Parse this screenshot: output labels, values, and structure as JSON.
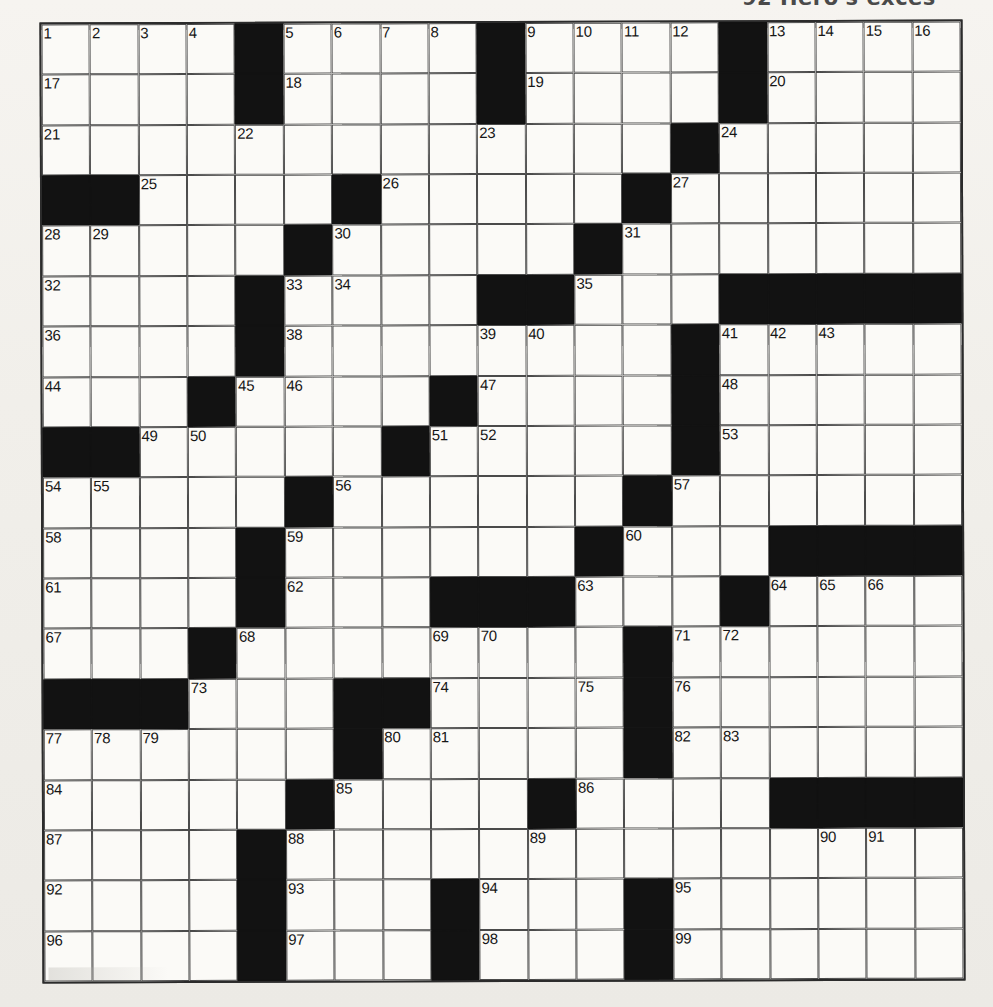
{
  "page": {
    "clue_fragment": "92  Hero's exces"
  },
  "grid": {
    "columns": 19,
    "rows": 19,
    "colors": {
      "block": "#121212",
      "cell": "#fbfaf7",
      "rule": "#4a4a4a",
      "number": "#161616",
      "paper": "#f2f0ec"
    },
    "legend": {
      "W": "open letter square",
      "B": "blocked square"
    },
    "pattern": [
      "WWWWBWWWWBWWWWBWWWW",
      "WWWWBWWWWBWWWWBWWWW",
      "WWWWWWWWWWWWWBWWWWW",
      "BBWWWWBWWWWWBWWWWWW",
      "WWWWWBWWWWWBWWWWWWW",
      "WWWWBWWWWBBWWWBBBBB",
      "WWWWBWWWWWWWWBWWWWW",
      "WWWBWWWWBWWWWBWWWWW",
      "BBWWWWWBWWWWWBWWWWW",
      "WWWWWBWWWWWWBWWWWWW",
      "WWWWBWWWWWWBWWWBBBB",
      "WWWWBWWWBBBWWWBWWWW",
      "WWWBWWWWWWWWBWWWWWW",
      "BBBWWWBBWWWWBWWWWWW",
      "WWWWWWBWWWWWBWWWWWW",
      "WWWWWBWWWWBWWWWBBBB",
      "WWWWBWWWWWWWWWWWWWW",
      "WWWWBWWWBWWWBWWWWWW",
      "WWWWBWWWBWWWBWWWWWW"
    ],
    "numbers": [
      {
        "row": 1,
        "col": 1,
        "label": "1"
      },
      {
        "row": 1,
        "col": 2,
        "label": "2"
      },
      {
        "row": 1,
        "col": 3,
        "label": "3"
      },
      {
        "row": 1,
        "col": 4,
        "label": "4"
      },
      {
        "row": 1,
        "col": 6,
        "label": "5"
      },
      {
        "row": 1,
        "col": 7,
        "label": "6"
      },
      {
        "row": 1,
        "col": 8,
        "label": "7"
      },
      {
        "row": 1,
        "col": 9,
        "label": "8"
      },
      {
        "row": 1,
        "col": 11,
        "label": "9"
      },
      {
        "row": 1,
        "col": 12,
        "label": "10"
      },
      {
        "row": 1,
        "col": 13,
        "label": "11"
      },
      {
        "row": 1,
        "col": 14,
        "label": "12"
      },
      {
        "row": 1,
        "col": 16,
        "label": "13"
      },
      {
        "row": 1,
        "col": 17,
        "label": "14"
      },
      {
        "row": 1,
        "col": 18,
        "label": "15"
      },
      {
        "row": 1,
        "col": 19,
        "label": "16"
      },
      {
        "row": 2,
        "col": 1,
        "label": "17"
      },
      {
        "row": 2,
        "col": 6,
        "label": "18"
      },
      {
        "row": 2,
        "col": 11,
        "label": "19"
      },
      {
        "row": 2,
        "col": 16,
        "label": "20"
      },
      {
        "row": 3,
        "col": 1,
        "label": "21"
      },
      {
        "row": 3,
        "col": 5,
        "label": "22"
      },
      {
        "row": 3,
        "col": 10,
        "label": "23"
      },
      {
        "row": 3,
        "col": 15,
        "label": "24"
      },
      {
        "row": 4,
        "col": 3,
        "label": "25"
      },
      {
        "row": 4,
        "col": 8,
        "label": "26"
      },
      {
        "row": 4,
        "col": 14,
        "label": "27"
      },
      {
        "row": 5,
        "col": 1,
        "label": "28"
      },
      {
        "row": 5,
        "col": 2,
        "label": "29"
      },
      {
        "row": 5,
        "col": 7,
        "label": "30"
      },
      {
        "row": 5,
        "col": 13,
        "label": "31"
      },
      {
        "row": 6,
        "col": 1,
        "label": "32"
      },
      {
        "row": 6,
        "col": 6,
        "label": "33"
      },
      {
        "row": 6,
        "col": 7,
        "label": "34"
      },
      {
        "row": 6,
        "col": 12,
        "label": "35"
      },
      {
        "row": 7,
        "col": 1,
        "label": "36"
      },
      {
        "row": 7,
        "col": 5,
        "label": "37"
      },
      {
        "row": 7,
        "col": 6,
        "label": "38"
      },
      {
        "row": 7,
        "col": 10,
        "label": "39"
      },
      {
        "row": 7,
        "col": 11,
        "label": "40"
      },
      {
        "row": 7,
        "col": 15,
        "label": "41"
      },
      {
        "row": 7,
        "col": 16,
        "label": "42"
      },
      {
        "row": 7,
        "col": 17,
        "label": "43"
      },
      {
        "row": 8,
        "col": 1,
        "label": "44"
      },
      {
        "row": 8,
        "col": 5,
        "label": "45"
      },
      {
        "row": 8,
        "col": 6,
        "label": "46"
      },
      {
        "row": 8,
        "col": 10,
        "label": "47"
      },
      {
        "row": 8,
        "col": 15,
        "label": "48"
      },
      {
        "row": 9,
        "col": 3,
        "label": "49"
      },
      {
        "row": 9,
        "col": 4,
        "label": "50"
      },
      {
        "row": 9,
        "col": 9,
        "label": "51"
      },
      {
        "row": 9,
        "col": 10,
        "label": "52"
      },
      {
        "row": 9,
        "col": 15,
        "label": "53"
      },
      {
        "row": 10,
        "col": 1,
        "label": "54"
      },
      {
        "row": 10,
        "col": 2,
        "label": "55"
      },
      {
        "row": 10,
        "col": 7,
        "label": "56"
      },
      {
        "row": 10,
        "col": 14,
        "label": "57"
      },
      {
        "row": 11,
        "col": 1,
        "label": "58"
      },
      {
        "row": 11,
        "col": 6,
        "label": "59"
      },
      {
        "row": 11,
        "col": 13,
        "label": "60"
      },
      {
        "row": 12,
        "col": 1,
        "label": "61"
      },
      {
        "row": 12,
        "col": 6,
        "label": "62"
      },
      {
        "row": 12,
        "col": 12,
        "label": "63"
      },
      {
        "row": 12,
        "col": 16,
        "label": "64"
      },
      {
        "row": 12,
        "col": 17,
        "label": "65"
      },
      {
        "row": 12,
        "col": 18,
        "label": "66"
      },
      {
        "row": 13,
        "col": 1,
        "label": "67"
      },
      {
        "row": 13,
        "col": 5,
        "label": "68"
      },
      {
        "row": 13,
        "col": 9,
        "label": "69"
      },
      {
        "row": 13,
        "col": 10,
        "label": "70"
      },
      {
        "row": 13,
        "col": 14,
        "label": "71"
      },
      {
        "row": 13,
        "col": 15,
        "label": "72"
      },
      {
        "row": 14,
        "col": 4,
        "label": "73"
      },
      {
        "row": 14,
        "col": 9,
        "label": "74"
      },
      {
        "row": 14,
        "col": 12,
        "label": "75"
      },
      {
        "row": 14,
        "col": 14,
        "label": "76"
      },
      {
        "row": 15,
        "col": 1,
        "label": "77"
      },
      {
        "row": 15,
        "col": 2,
        "label": "78"
      },
      {
        "row": 15,
        "col": 3,
        "label": "79"
      },
      {
        "row": 15,
        "col": 8,
        "label": "80"
      },
      {
        "row": 15,
        "col": 9,
        "label": "81"
      },
      {
        "row": 15,
        "col": 14,
        "label": "82"
      },
      {
        "row": 15,
        "col": 15,
        "label": "83"
      },
      {
        "row": 16,
        "col": 1,
        "label": "84"
      },
      {
        "row": 16,
        "col": 7,
        "label": "85"
      },
      {
        "row": 16,
        "col": 12,
        "label": "86"
      },
      {
        "row": 17,
        "col": 1,
        "label": "87"
      },
      {
        "row": 17,
        "col": 6,
        "label": "88"
      },
      {
        "row": 17,
        "col": 11,
        "label": "89"
      },
      {
        "row": 17,
        "col": 17,
        "label": "90"
      },
      {
        "row": 17,
        "col": 18,
        "label": "91"
      },
      {
        "row": 18,
        "col": 1,
        "label": "92"
      },
      {
        "row": 18,
        "col": 6,
        "label": "93"
      },
      {
        "row": 18,
        "col": 10,
        "label": "94"
      },
      {
        "row": 18,
        "col": 14,
        "label": "95"
      },
      {
        "row": 19,
        "col": 1,
        "label": "96"
      },
      {
        "row": 19,
        "col": 6,
        "label": "97"
      },
      {
        "row": 19,
        "col": 10,
        "label": "98"
      },
      {
        "row": 19,
        "col": 14,
        "label": "99"
      }
    ]
  }
}
